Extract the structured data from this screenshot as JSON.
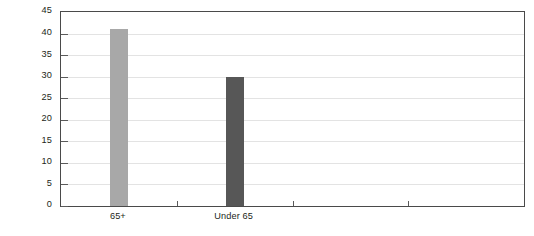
{
  "chart_data": {
    "type": "bar",
    "title": "",
    "subtitle": "",
    "xlabel": "",
    "ylabel": "Percentage Saying They Are Very Happy",
    "ylabel_lines": [
      "Percentage Saying They",
      "Are Very Happy"
    ],
    "categories": [
      "65+",
      "Under 65"
    ],
    "values": [
      41,
      30
    ],
    "bar_colors": [
      "#a8a8a8",
      "#575757"
    ],
    "ylim": [
      0,
      45
    ],
    "ytick_values": [
      0,
      5,
      10,
      15,
      20,
      25,
      30,
      35,
      40,
      45
    ],
    "ytick_labels": [
      "0",
      "5",
      "10",
      "15",
      "20",
      "25",
      "30",
      "35",
      "40",
      "45"
    ],
    "grid": true,
    "grid_axis": "y",
    "legend": false,
    "legend_position": "none",
    "x_slot_count": 4,
    "series": [
      {
        "name": "Percentage Saying They Are Very Happy",
        "values": [
          41,
          30
        ]
      }
    ],
    "annotations": []
  },
  "style": {
    "background": "#ffffff",
    "axis_color": "#4a4a4a",
    "grid_color": "#e3e3e3",
    "tick_color": "#5a5a5a",
    "text_color": "#231f20"
  }
}
